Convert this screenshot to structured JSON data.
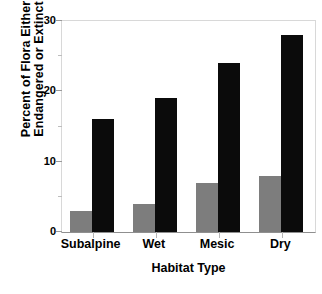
{
  "chart_data": {
    "type": "bar",
    "title": "",
    "xlabel": "Habitat Type",
    "ylabel_lines": [
      "Percent of Flora Either",
      "Endangered or Extinct"
    ],
    "ylabel": "Percent of Flora Either Endangered or Extinct",
    "categories": [
      "Subalpine",
      "Wet",
      "Mesic",
      "Dry"
    ],
    "series": [
      {
        "name": "series-gray",
        "color": "#7d7d7d",
        "values": [
          3,
          4,
          7,
          8
        ]
      },
      {
        "name": "series-black",
        "color": "#0b0b0b",
        "values": [
          16,
          19,
          24,
          28
        ]
      }
    ],
    "ylim": [
      0,
      30
    ],
    "ytick_labels": [
      "0",
      "10",
      "20",
      "30"
    ],
    "ytick_values": [
      0,
      10,
      20,
      30
    ],
    "yminor_values": [
      5,
      15,
      25
    ],
    "grid": false,
    "legend": "none"
  }
}
